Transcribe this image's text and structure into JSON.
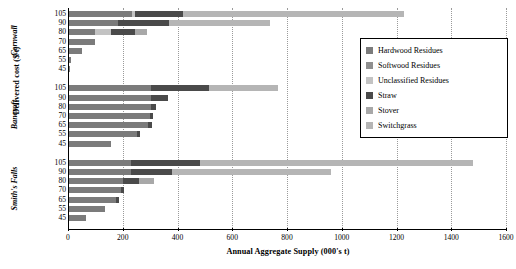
{
  "chart_data": {
    "type": "bar",
    "orientation": "horizontal",
    "stacked": true,
    "title": "",
    "xlabel": "Annual Aggregate Supply (000's t)",
    "ylabel": "Delivered cost ($/t)",
    "xlim": [
      0,
      1600
    ],
    "xticks": [
      0,
      200,
      400,
      600,
      800,
      1000,
      1200,
      1400,
      1600
    ],
    "grid": "vertical-dotted",
    "legend_position": "right-inside",
    "series_names": [
      "Hardwood Residues",
      "Softwood Residues",
      "Unclassified Residues",
      "Straw",
      "Stover",
      "Switchgrass"
    ],
    "series_colors": [
      "#7b7b7b",
      "#8f8f8f",
      "#c3c3c3",
      "#4a4a4a",
      "#a8a8a8",
      "#b5b5b5"
    ],
    "groups": [
      {
        "name": "Cornwall",
        "categories": [
          "105",
          "90",
          "80",
          "70",
          "65",
          "55",
          "45"
        ],
        "rows": [
          {
            "category": "105",
            "values": [
              230,
              0,
              10,
              175,
              0,
              810
            ],
            "total": 1225
          },
          {
            "category": "90",
            "values": [
              180,
              0,
              0,
              185,
              0,
              370
            ],
            "total": 735
          },
          {
            "category": "80",
            "values": [
              95,
              0,
              60,
              85,
              45,
              0
            ],
            "total": 285
          },
          {
            "category": "70",
            "values": [
              95,
              0,
              0,
              0,
              0,
              0
            ],
            "total": 95
          },
          {
            "category": "65",
            "values": [
              48,
              0,
              0,
              0,
              0,
              0
            ],
            "total": 48
          },
          {
            "category": "55",
            "values": [
              8,
              0,
              0,
              0,
              0,
              0
            ],
            "total": 8
          },
          {
            "category": "45",
            "values": [
              4,
              0,
              0,
              0,
              0,
              0
            ],
            "total": 4
          }
        ]
      },
      {
        "name": "Bancroft",
        "categories": [
          "105",
          "90",
          "80",
          "70",
          "65",
          "55",
          "45"
        ],
        "rows": [
          {
            "category": "105",
            "values": [
              300,
              0,
              0,
              210,
              0,
              255
            ],
            "total": 765
          },
          {
            "category": "90",
            "values": [
              300,
              0,
              0,
              62,
              0,
              0
            ],
            "total": 362
          },
          {
            "category": "80",
            "values": [
              300,
              0,
              0,
              18,
              0,
              0
            ],
            "total": 318
          },
          {
            "category": "70",
            "values": [
              295,
              0,
              0,
              12,
              0,
              0
            ],
            "total": 307
          },
          {
            "category": "65",
            "values": [
              290,
              0,
              0,
              12,
              0,
              0
            ],
            "total": 302
          },
          {
            "category": "55",
            "values": [
              248,
              0,
              0,
              10,
              0,
              0
            ],
            "total": 258
          },
          {
            "category": "45",
            "values": [
              152,
              0,
              0,
              0,
              0,
              0
            ],
            "total": 152
          }
        ]
      },
      {
        "name": "Smith's Falls",
        "categories": [
          "105",
          "90",
          "80",
          "70",
          "65",
          "55",
          "45"
        ],
        "rows": [
          {
            "category": "105",
            "values": [
              228,
              0,
              0,
              252,
              0,
              995
            ],
            "total": 1475
          },
          {
            "category": "90",
            "values": [
              228,
              0,
              0,
              148,
              0,
              580
            ],
            "total": 956
          },
          {
            "category": "80",
            "values": [
              196,
              0,
              0,
              58,
              56,
              0
            ],
            "total": 310
          },
          {
            "category": "70",
            "values": [
              190,
              0,
              0,
              12,
              0,
              0
            ],
            "total": 202
          },
          {
            "category": "65",
            "values": [
              172,
              0,
              0,
              10,
              0,
              0
            ],
            "total": 182
          },
          {
            "category": "55",
            "values": [
              130,
              0,
              0,
              0,
              0,
              0
            ],
            "total": 130
          },
          {
            "category": "45",
            "values": [
              62,
              0,
              0,
              0,
              0,
              0
            ],
            "total": 62
          }
        ]
      }
    ]
  }
}
